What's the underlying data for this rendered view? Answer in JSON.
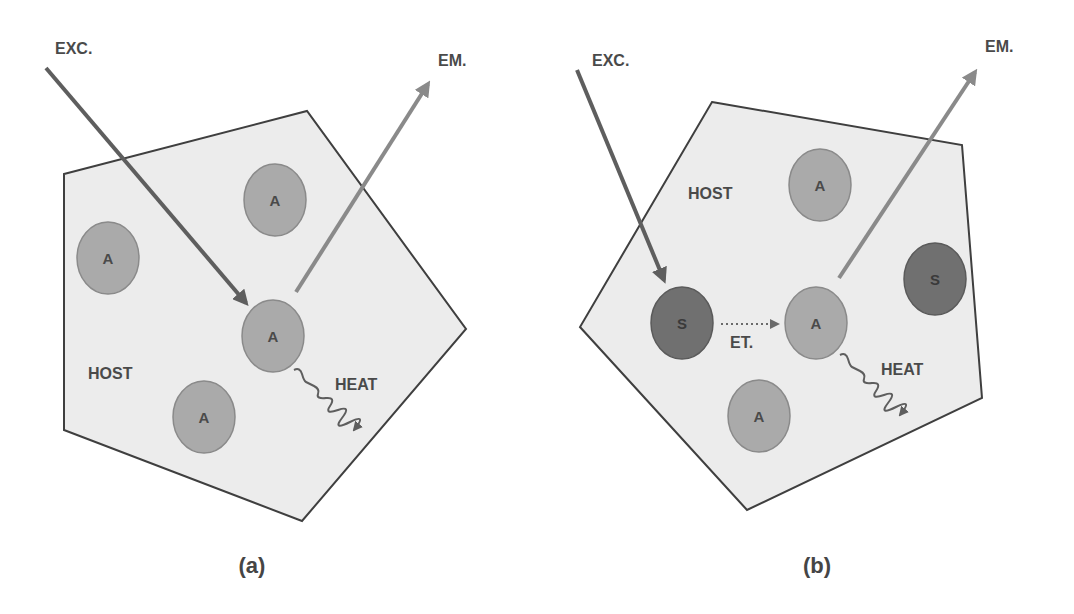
{
  "colors": {
    "host_fill": "#ececec",
    "host_stroke": "#3f3f3f",
    "activator_fill": "#aaaaaa",
    "sensitizer_fill": "#707070",
    "exc_arrow": "#5e5e5e",
    "em_arrow": "#8a8a8a",
    "text": "#4a4a4a"
  },
  "panel_a": {
    "caption": "(a)",
    "host_label": "HOST",
    "exc_label": "EXC.",
    "em_label": "EM.",
    "heat_label": "HEAT",
    "particles": [
      {
        "label": "A",
        "type": "activator"
      },
      {
        "label": "A",
        "type": "activator"
      },
      {
        "label": "A",
        "type": "activator"
      },
      {
        "label": "A",
        "type": "activator"
      }
    ]
  },
  "panel_b": {
    "caption": "(b)",
    "host_label": "HOST",
    "exc_label": "EXC.",
    "em_label": "EM.",
    "heat_label": "HEAT",
    "et_label": "ET.",
    "particles": [
      {
        "label": "A",
        "type": "activator"
      },
      {
        "label": "S",
        "type": "sensitizer"
      },
      {
        "label": "S",
        "type": "sensitizer"
      },
      {
        "label": "A",
        "type": "activator"
      },
      {
        "label": "A",
        "type": "activator"
      }
    ]
  }
}
